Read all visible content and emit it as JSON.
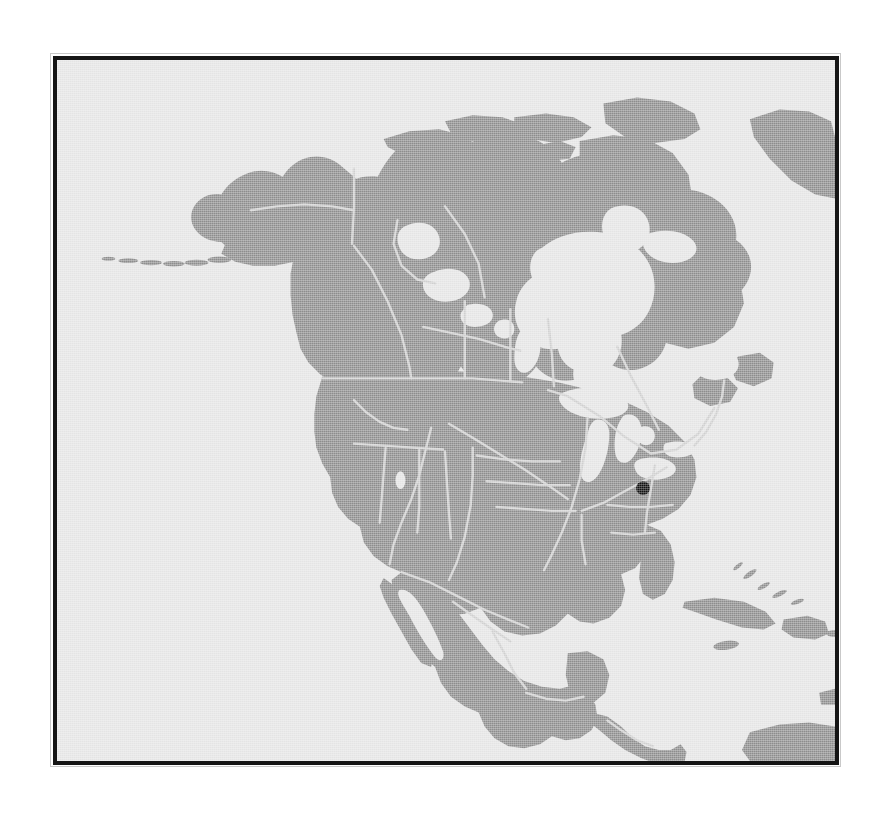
{
  "figure": {
    "kind": "distribution-map",
    "region_title": "North America",
    "caption": "",
    "frame_color": "#151515",
    "frame_outer_color": "#c9c9c9",
    "background_color": "#ffffff"
  },
  "map": {
    "projection_hint": "conic",
    "ocean_color": "#e4e4e4",
    "land_color": "#8d8d8d",
    "border_line_color": "#cfcfcf",
    "marker_color": "#111111",
    "lake_color": "#e4e4e4",
    "view_box": "0 0 786 709",
    "extent": {
      "west_label": "Pacific Ocean",
      "east_label": "Atlantic Ocean",
      "south_label": "Gulf of Mexico",
      "north_label": "Arctic Ocean"
    }
  },
  "features": {
    "landmasses": [
      "North American mainland",
      "Alaska",
      "Aleutian Islands",
      "Canadian Arctic Archipelago",
      "Baffin Island",
      "Newfoundland",
      "Nova Scotia",
      "Vancouver Island",
      "Baja California",
      "Yucatan Peninsula",
      "Florida Peninsula",
      "Cuba",
      "Hispaniola",
      "Jamaica",
      "Bahamas",
      "Central America",
      "northern South America"
    ],
    "water_bodies": [
      "Hudson Bay",
      "James Bay",
      "Great Lakes",
      "Great Slave Lake",
      "Great Bear Lake",
      "Lake Winnipeg",
      "Great Salt Lake",
      "Gulf of Mexico",
      "Gulf of California",
      "Gulf of St. Lawrence"
    ],
    "boundary_lines": "state, provincial and major river lines shown in light grey"
  },
  "markers": [
    {
      "id": "occurrence-point-1",
      "label": "",
      "shape": "filled-circle",
      "color": "#111111",
      "radius_px": 7,
      "x_px": 592,
      "y_px": 433,
      "approx_location": "eastern United States (Kentucky / Tennessee region)"
    }
  ],
  "legend": {
    "visible": false,
    "entries": []
  },
  "scale_bar": {
    "visible": false,
    "text": ""
  }
}
